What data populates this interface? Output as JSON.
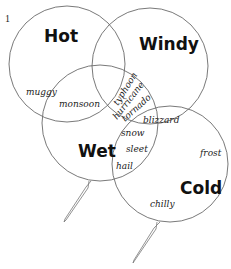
{
  "figure": {
    "number": "1"
  },
  "sets": {
    "hot": {
      "label": "Hot"
    },
    "windy": {
      "label": "Windy"
    },
    "wet": {
      "label": "Wet"
    },
    "cold": {
      "label": "Cold"
    }
  },
  "regions": {
    "hot_only": [
      "muggy"
    ],
    "hot_wet": [
      "monsoon"
    ],
    "hot_windy_wet": [
      "typhoon",
      "hurricane",
      "tornado"
    ],
    "windy_cold": [
      "blizzard"
    ],
    "wet_cold": [
      "snow",
      "sleet",
      "hail"
    ],
    "cold_only": [
      "frost",
      "chilly"
    ]
  },
  "words": {
    "muggy": "muggy",
    "monsoon": "monsoon",
    "typhoon": "typhoon",
    "hurricane": "hurricane",
    "tornado": "tornado",
    "blizzard": "blizzard",
    "snow": "snow",
    "sleet": "sleet",
    "hail": "hail",
    "frost": "frost",
    "chilly": "chilly"
  },
  "colors": {
    "outline": "#6a6a6a",
    "text": "#111111",
    "background": "#ffffff"
  }
}
